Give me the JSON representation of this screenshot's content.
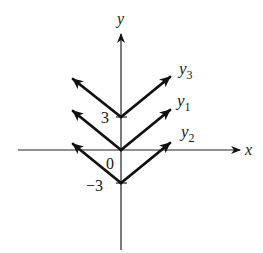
{
  "diagram": {
    "type": "function-graph",
    "axes": {
      "x_label": "x",
      "y_label": "y"
    },
    "tick_labels": {
      "top": "3",
      "origin": "0",
      "bottom": "−3"
    },
    "curves": [
      {
        "name": "y",
        "subscript": "3",
        "vertex_y": 3,
        "color": "#111111"
      },
      {
        "name": "y",
        "subscript": "1",
        "vertex_y": 0,
        "color": "#111111"
      },
      {
        "name": "y",
        "subscript": "2",
        "vertex_y": -3,
        "color": "#111111"
      }
    ]
  }
}
